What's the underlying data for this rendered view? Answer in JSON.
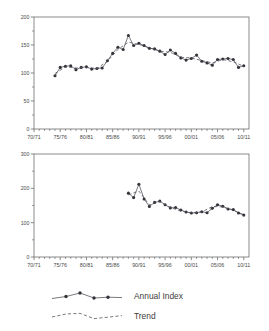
{
  "chart_data": [
    {
      "id": "top",
      "type": "line",
      "title": "",
      "xlabel": "",
      "ylabel": "",
      "xlim": [
        1970,
        2011
      ],
      "ylim": [
        0,
        200
      ],
      "yticks": [
        0,
        50,
        100,
        150,
        200
      ],
      "yticklabels": [
        "0",
        "50",
        "100",
        "150",
        "200"
      ],
      "xticks": [
        1970,
        1975,
        1980,
        1985,
        1990,
        1995,
        2000,
        2005,
        2010
      ],
      "xticklabels": [
        "70/71",
        "75/76",
        "80/81",
        "85/86",
        "90/91",
        "95/96",
        "00/01",
        "05/06",
        "10/11"
      ],
      "minor_ticks_per_interval": 5,
      "grid": false,
      "legend_position": "below-figure",
      "series": [
        {
          "name": "Annual Index",
          "style": "solid-with-markers",
          "x": [
            1974,
            1975,
            1976,
            1977,
            1978,
            1979,
            1980,
            1981,
            1982,
            1983,
            1984,
            1985,
            1986,
            1987,
            1988,
            1989,
            1990,
            1991,
            1992,
            1993,
            1994,
            1995,
            1996,
            1997,
            1998,
            1999,
            2000,
            2001,
            2002,
            2003,
            2004,
            2005,
            2006,
            2007,
            2008,
            2009,
            2010
          ],
          "values": [
            95,
            110,
            112,
            113,
            106,
            110,
            111,
            107,
            108,
            109,
            122,
            135,
            146,
            142,
            167,
            149,
            153,
            149,
            144,
            143,
            139,
            133,
            141,
            135,
            127,
            123,
            126,
            132,
            121,
            118,
            114,
            124,
            125,
            126,
            124,
            110,
            113
          ]
        },
        {
          "name": "Trend",
          "style": "dashed",
          "x": [
            1974,
            1976,
            1978,
            1980,
            1982,
            1984,
            1986,
            1988,
            1990,
            1992,
            1994,
            1996,
            1998,
            2000,
            2002,
            2004,
            2006,
            2008,
            2010
          ],
          "values": [
            99,
            111,
            109,
            110,
            108,
            121,
            142,
            155,
            151,
            145,
            139,
            137,
            128,
            127,
            122,
            118,
            124,
            120,
            112
          ]
        }
      ]
    },
    {
      "id": "bottom",
      "type": "line",
      "title": "",
      "xlabel": "",
      "ylabel": "",
      "xlim": [
        1970,
        2011
      ],
      "ylim": [
        0,
        300
      ],
      "yticks": [
        0,
        100,
        200,
        300
      ],
      "yticklabels": [
        "0",
        "100",
        "200",
        "300"
      ],
      "xticks": [
        1970,
        1975,
        1980,
        1985,
        1990,
        1995,
        2000,
        2005,
        2010
      ],
      "xticklabels": [
        "70/71",
        "75/76",
        "80/81",
        "85/86",
        "90/91",
        "95/96",
        "00/01",
        "05/06",
        "10/11"
      ],
      "minor_ticks_per_interval": 5,
      "grid": false,
      "legend_position": "below-figure",
      "series": [
        {
          "name": "Annual Index",
          "style": "solid-with-markers",
          "x": [
            1988,
            1989,
            1990,
            1991,
            1992,
            1993,
            1994,
            1995,
            1996,
            1997,
            1998,
            1999,
            2000,
            2001,
            2002,
            2003,
            2004,
            2005,
            2006,
            2007,
            2008,
            2009,
            2010
          ],
          "values": [
            186,
            173,
            212,
            169,
            147,
            159,
            163,
            152,
            143,
            144,
            137,
            131,
            128,
            129,
            132,
            129,
            142,
            152,
            148,
            140,
            138,
            128,
            122
          ]
        },
        {
          "name": "Trend",
          "style": "dashed",
          "x": [
            1988,
            1990,
            1992,
            1994,
            1996,
            1998,
            2000,
            2002,
            2004,
            2006,
            2008,
            2010
          ],
          "values": [
            181,
            192,
            152,
            161,
            144,
            134,
            129,
            131,
            147,
            146,
            136,
            123
          ]
        }
      ]
    }
  ],
  "legend": {
    "items": [
      {
        "label": "Annual Index",
        "style": "solid-with-markers"
      },
      {
        "label": "Trend",
        "style": "dashed"
      }
    ]
  },
  "axes": {
    "top": {
      "yticklabels": [
        "200",
        "150",
        "100",
        "50",
        "0"
      ],
      "xticklabels": [
        "70/71",
        "75/76",
        "80/81",
        "85/86",
        "90/91",
        "95/96",
        "00/01",
        "05/06",
        "10/11"
      ]
    },
    "bottom": {
      "yticklabels": [
        "300",
        "200",
        "100",
        "0"
      ],
      "xticklabels": [
        "70/71",
        "75/76",
        "80/81",
        "85/86",
        "90/91",
        "95/96",
        "00/01",
        "05/06",
        "10/11"
      ]
    }
  },
  "colors": {
    "line": "#4d4d55",
    "marker": "#33333a",
    "axis": "#6f6f6f",
    "text": "#4a4a4a",
    "background": "#ffffff"
  }
}
